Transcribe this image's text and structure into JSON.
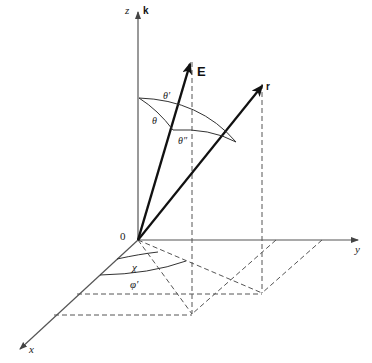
{
  "diagram": {
    "axes": {
      "z": {
        "label": "z",
        "unit_label": "k"
      },
      "y": {
        "label": "y"
      },
      "x": {
        "label": "x"
      },
      "origin": {
        "label": "0"
      }
    },
    "vectors": {
      "E": {
        "label": "E"
      },
      "r": {
        "label": "r"
      }
    },
    "angles": {
      "theta": "θ",
      "theta_prime": "θ′",
      "theta_double_prime": "θ″",
      "chi": "χ",
      "phi_prime": "φ′"
    },
    "colors": {
      "ink": "#222222",
      "axis": "#555555",
      "dashed": "#555555"
    }
  }
}
